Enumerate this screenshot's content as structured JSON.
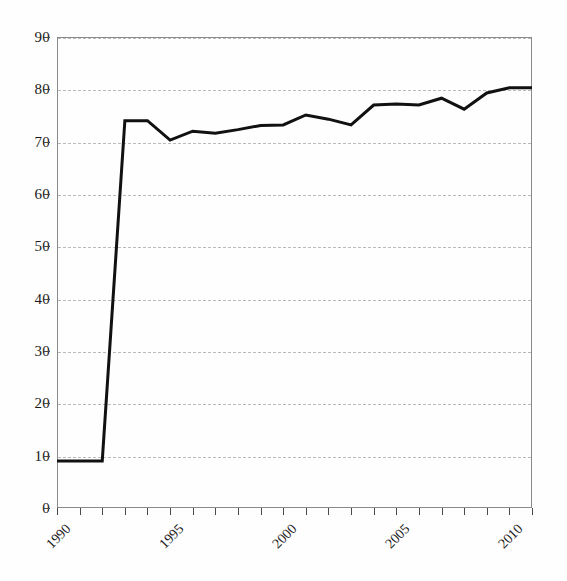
{
  "chart_data": {
    "type": "line",
    "title": "",
    "subtitle": "",
    "xlabel": "",
    "ylabel": "",
    "xlim": [
      1990,
      2011
    ],
    "ylim": [
      0,
      90
    ],
    "ytick_step": 10,
    "grid": true,
    "grid_style": "dashed",
    "legend": false,
    "legend_position": "none",
    "line_color": "#111111",
    "line_width": 3,
    "markers": false,
    "yticks": [
      0,
      10,
      20,
      30,
      40,
      50,
      60,
      70,
      80,
      90
    ],
    "ytick_labels": [
      "0",
      "10",
      "20",
      "30",
      "40",
      "50",
      "60",
      "70",
      "80",
      "90"
    ],
    "xticks": [
      1990,
      1991,
      1992,
      1993,
      1994,
      1995,
      1996,
      1997,
      1998,
      1999,
      2000,
      2001,
      2002,
      2003,
      2004,
      2005,
      2006,
      2007,
      2008,
      2009,
      2010,
      2011
    ],
    "xtick_labels_shown": [
      "1990",
      "1995",
      "2000",
      "2005",
      "2010"
    ],
    "xtick_labels_shown_values": [
      1990,
      1995,
      2000,
      2005,
      2010
    ],
    "x": [
      1990,
      1991,
      1992,
      1993,
      1994,
      1995,
      1996,
      1997,
      1998,
      1999,
      2000,
      2001,
      2002,
      2003,
      2004,
      2005,
      2006,
      2007,
      2008,
      2009,
      2010,
      2011
    ],
    "values": [
      9.0,
      9.0,
      9.0,
      74.0,
      74.0,
      70.3,
      72.0,
      71.6,
      72.3,
      73.1,
      73.2,
      75.1,
      74.3,
      73.2,
      77.0,
      77.2,
      77.0,
      78.3,
      76.2,
      79.3,
      80.3,
      80.3
    ],
    "series": [
      {
        "name": "",
        "values": [
          9.0,
          9.0,
          9.0,
          74.0,
          74.0,
          70.3,
          72.0,
          71.6,
          72.3,
          73.1,
          73.2,
          75.1,
          74.3,
          73.2,
          77.0,
          77.2,
          77.0,
          78.3,
          76.2,
          79.3,
          80.3,
          80.3
        ]
      }
    ],
    "annotations": [],
    "background_color": "#ffffff",
    "frame_color": "#8a8a8a",
    "gridline_color": "#b9b9b9"
  }
}
